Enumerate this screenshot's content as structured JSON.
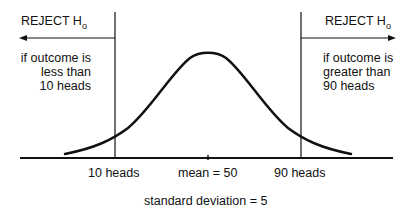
{
  "diagram": {
    "left_region": {
      "heading": "REJECT H",
      "heading_sub": "o",
      "description": [
        "if outcome is",
        "less than",
        "10 heads"
      ]
    },
    "right_region": {
      "heading": "REJECT H",
      "heading_sub": "o",
      "description": [
        "if outcome is",
        "greater than",
        "90 heads"
      ]
    },
    "axis_labels": {
      "left_cutoff": "10 heads",
      "mean": "mean = 50",
      "right_cutoff": "90 heads"
    },
    "footnote": "standard deviation = 5",
    "colors": {
      "line": "#111111",
      "background": "#ffffff"
    }
  }
}
